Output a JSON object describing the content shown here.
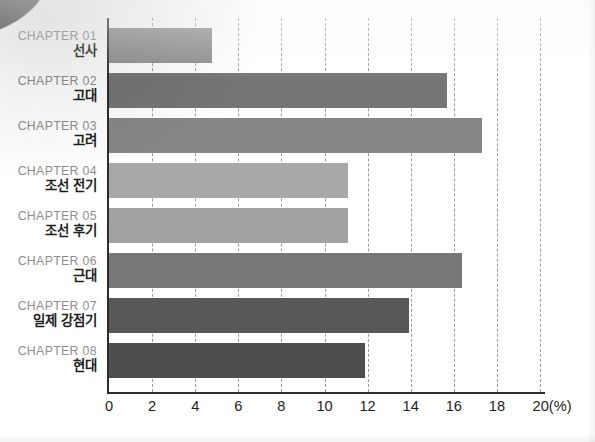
{
  "chart_data": {
    "type": "bar",
    "orientation": "horizontal",
    "title": "",
    "xlabel": "(%)",
    "ylabel": "",
    "xlim": [
      0,
      20
    ],
    "xticks": [
      0,
      2,
      4,
      6,
      8,
      10,
      12,
      14,
      16,
      18,
      20
    ],
    "xtick_labels": [
      "0",
      "2",
      "4",
      "6",
      "8",
      "10",
      "12",
      "14",
      "16",
      "18",
      "20(%)"
    ],
    "grid": "vertical-dashed",
    "legend": "none",
    "unit_suffix": "(%)",
    "categories": [
      "CHAPTER 01 선사",
      "CHAPTER 02 고대",
      "CHAPTER 03 고려",
      "CHAPTER 04 조선 전기",
      "CHAPTER 05 조선 후기",
      "CHAPTER 06 근대",
      "CHAPTER 07 일제 강점기",
      "CHAPTER 08 현대"
    ],
    "values": [
      4.8,
      15.7,
      17.3,
      11.1,
      11.1,
      16.4,
      13.9,
      11.9
    ],
    "bars": [
      {
        "chapter": "CHAPTER 01",
        "name": "선사",
        "value": 4.8,
        "color": "#8c8c8c"
      },
      {
        "chapter": "CHAPTER 02",
        "name": "고대",
        "value": 15.7,
        "color": "#757575"
      },
      {
        "chapter": "CHAPTER 03",
        "name": "고려",
        "value": 17.3,
        "color": "#878787"
      },
      {
        "chapter": "CHAPTER 04",
        "name": "조선 전기",
        "value": 11.1,
        "color": "#a8a8a8"
      },
      {
        "chapter": "CHAPTER 05",
        "name": "조선 후기",
        "value": 11.1,
        "color": "#a2a2a2"
      },
      {
        "chapter": "CHAPTER 06",
        "name": "근대",
        "value": 16.4,
        "color": "#787878"
      },
      {
        "chapter": "CHAPTER 07",
        "name": "일제 강점기",
        "value": 13.9,
        "color": "#585858"
      },
      {
        "chapter": "CHAPTER 08",
        "name": "현대",
        "value": 11.9,
        "color": "#4e4e4e"
      }
    ],
    "colors": {
      "axis": "#2c2c2c",
      "gridline": "#9b9b9b",
      "chapter_label": "#8e8e8e",
      "name_label": "#1d1d1d",
      "background": "#ffffff"
    }
  }
}
